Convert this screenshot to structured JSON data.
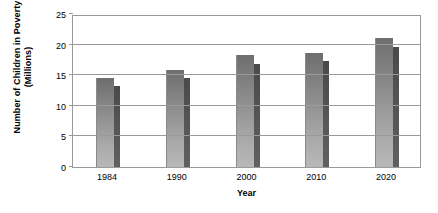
{
  "chart_data": {
    "type": "bar",
    "title": "",
    "xlabel": "Year",
    "ylabel": "Number of Children in Poverty\n(Millions)",
    "categories": [
      "1984",
      "1990",
      "2000",
      "2010",
      "2020"
    ],
    "series": [
      {
        "name": "front-bar",
        "color": "#8d8d8d",
        "values": [
          14.6,
          15.8,
          18.3,
          18.7,
          21.0
        ]
      },
      {
        "name": "back-bar",
        "color": "#555555",
        "values": [
          13.3,
          14.5,
          16.9,
          17.4,
          19.6
        ]
      }
    ],
    "ylim": [
      0,
      25
    ],
    "yticks": [
      "0",
      "5",
      "10",
      "15",
      "20",
      "25"
    ],
    "ytick_values": [
      0,
      5,
      10,
      15,
      20,
      25
    ],
    "grid": true,
    "legend": "none",
    "axis_color": "#9a9a9a"
  }
}
